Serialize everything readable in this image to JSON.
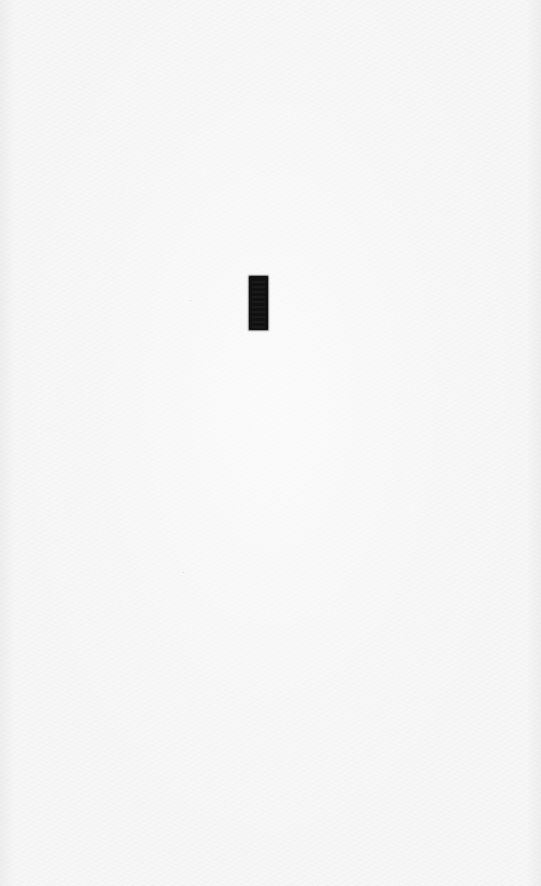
{
  "page": {
    "background_color": "#f6f6f6",
    "text": ""
  },
  "mark": {
    "shape": "rectangle",
    "color": "#111111"
  },
  "specks": [
    {
      "x": 190,
      "y": 300
    },
    {
      "x": 183,
      "y": 572
    }
  ]
}
